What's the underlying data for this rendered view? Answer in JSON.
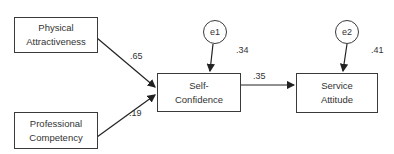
{
  "diagram": {
    "type": "path-model",
    "nodes": {
      "physical_attractiveness": {
        "line1": "Physical",
        "line2": "Attractiveness"
      },
      "professional_competency": {
        "line1": "Professional",
        "line2": "Competency"
      },
      "self_confidence": {
        "line1": "Self-",
        "line2": "Confidence"
      },
      "service_attitude": {
        "line1": "Service",
        "line2": "Attitude"
      }
    },
    "errors": {
      "e1": {
        "label": "e1",
        "r_squared": ".34"
      },
      "e2": {
        "label": "e2",
        "r_squared": ".41"
      }
    },
    "paths": {
      "pa_to_sc": ".65",
      "pc_to_sc": ".19",
      "sc_to_sa": ".35"
    }
  }
}
